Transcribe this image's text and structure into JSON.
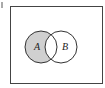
{
  "diagram": {
    "type": "venn",
    "sets": [
      {
        "id": "A",
        "label": "A"
      },
      {
        "id": "B",
        "label": "B"
      }
    ],
    "shaded_region": "A minus B",
    "colors": {
      "shade": "#d0d0d0",
      "stroke": "#333333",
      "background": "#ffffff"
    }
  }
}
